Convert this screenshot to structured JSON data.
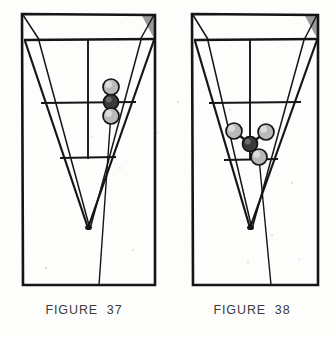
{
  "page": {
    "background_color": "#fdfdfc",
    "ink_color": "#1a1a1a",
    "caption_color": "#3c3c3c",
    "type": "scanned-textbook-plate",
    "figure_count": 2
  },
  "palette": {
    "line": "#151515",
    "shade_triangle": "#9a9a9a",
    "sphere_light_fill": "#b9b9b9",
    "sphere_light_highlight": "#dcdcdc",
    "sphere_dark_fill": "#3a3a3a",
    "sphere_dark_highlight": "#6a6a6a",
    "sphere_stroke": "#141414",
    "bond": "#1a1a1a"
  },
  "figures": [
    {
      "id": "figure-37",
      "caption": "FIGURE  37",
      "caption_label": "FIGURE",
      "caption_number": "37",
      "model_description": "three spheres in a vertical line",
      "sphere_count": 3,
      "frame": {
        "outer_rect": {
          "x": 22,
          "y": 14,
          "width": 133,
          "height": 271
        },
        "top_band_line_y": 40,
        "mid_line_y": 103,
        "lower_line_y": 158,
        "apex": {
          "x": 88,
          "y": 228
        },
        "shade_corner": "top-right"
      },
      "atoms": [
        {
          "name": "atom-top",
          "cx": 111,
          "cy": 87,
          "r": 8.0,
          "tone": "light"
        },
        {
          "name": "atom-center",
          "cx": 111,
          "cy": 102,
          "r": 7.5,
          "tone": "dark"
        },
        {
          "name": "atom-bottom",
          "cx": 111,
          "cy": 116,
          "r": 8.0,
          "tone": "light"
        }
      ],
      "bonds": [
        {
          "from": "atom-top",
          "to": "atom-center"
        },
        {
          "from": "atom-center",
          "to": "atom-bottom"
        }
      ]
    },
    {
      "id": "figure-38",
      "caption": "FIGURE  38",
      "caption_label": "FIGURE",
      "caption_number": "38",
      "model_description": "central sphere with three branching spheres",
      "sphere_count": 4,
      "frame": {
        "outer_rect": {
          "x": 24,
          "y": 14,
          "width": 126,
          "height": 271
        },
        "top_band_line_y": 40,
        "mid_line_y": 103,
        "lower_line_y": 160,
        "apex": {
          "x": 82,
          "y": 228
        },
        "shade_corner": "top-right"
      },
      "atoms": [
        {
          "name": "atom-center",
          "cx": 82,
          "cy": 144,
          "r": 7.5,
          "tone": "dark"
        },
        {
          "name": "atom-upper-left",
          "cx": 66,
          "cy": 131,
          "r": 8.0,
          "tone": "light"
        },
        {
          "name": "atom-upper-right",
          "cx": 98,
          "cy": 132,
          "r": 8.0,
          "tone": "light"
        },
        {
          "name": "atom-lower-right",
          "cx": 91,
          "cy": 157,
          "r": 8.0,
          "tone": "light"
        }
      ],
      "bonds": [
        {
          "from": "atom-center",
          "to": "atom-upper-left"
        },
        {
          "from": "atom-center",
          "to": "atom-upper-right"
        },
        {
          "from": "atom-center",
          "to": "atom-lower-right"
        }
      ]
    }
  ]
}
